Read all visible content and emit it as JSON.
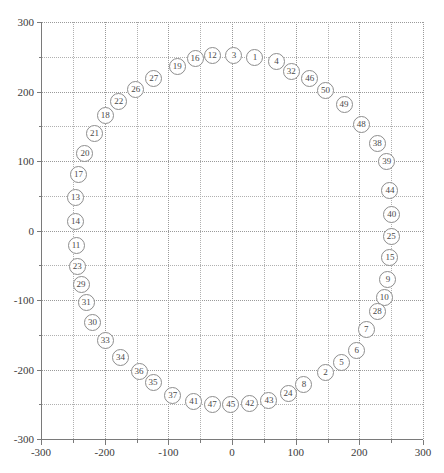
{
  "chart_data": {
    "type": "scatter",
    "title": "",
    "subtitle": "",
    "xlabel": "",
    "ylabel": "",
    "xlim": [
      -300,
      300
    ],
    "ylim": [
      -300,
      300
    ],
    "grid": true,
    "legend": null,
    "marker": "open-circle-with-number-label",
    "x_ticks": [
      -300,
      -200,
      -100,
      0,
      100,
      200,
      300
    ],
    "x_tick_labels": [
      "-300",
      "-200",
      "-100",
      "0",
      "100",
      "200",
      "300"
    ],
    "x_minor_ticks": [
      -250,
      -150,
      -50,
      50,
      150,
      250
    ],
    "y_ticks": [
      -300,
      -200,
      -100,
      0,
      100,
      200,
      300
    ],
    "y_tick_labels": [
      "-300",
      "-200",
      "-100",
      "0",
      "100",
      "200",
      "300"
    ],
    "y_minor_ticks": [
      -250,
      -150,
      -50,
      50,
      150,
      250
    ],
    "points": [
      {
        "label": "1",
        "x": 36,
        "y": 249
      },
      {
        "label": "2",
        "x": 147,
        "y": -205
      },
      {
        "label": "3",
        "x": 3,
        "y": 252
      },
      {
        "label": "4",
        "x": 70,
        "y": 243
      },
      {
        "label": "5",
        "x": 172,
        "y": -190
      },
      {
        "label": "6",
        "x": 196,
        "y": -172
      },
      {
        "label": "7",
        "x": 211,
        "y": -143
      },
      {
        "label": "8",
        "x": 113,
        "y": -221
      },
      {
        "label": "9",
        "x": 245,
        "y": -70
      },
      {
        "label": "10",
        "x": 239,
        "y": -97
      },
      {
        "label": "11",
        "x": -245,
        "y": -21
      },
      {
        "label": "12",
        "x": -31,
        "y": 252
      },
      {
        "label": "13",
        "x": -246,
        "y": 47
      },
      {
        "label": "14",
        "x": -246,
        "y": 13
      },
      {
        "label": "15",
        "x": 248,
        "y": -39
      },
      {
        "label": "16",
        "x": -58,
        "y": 247
      },
      {
        "label": "17",
        "x": -241,
        "y": 80
      },
      {
        "label": "18",
        "x": -199,
        "y": 165
      },
      {
        "label": "19",
        "x": -86,
        "y": 236
      },
      {
        "label": "20",
        "x": -231,
        "y": 111
      },
      {
        "label": "21",
        "x": -216,
        "y": 140
      },
      {
        "label": "22",
        "x": -178,
        "y": 185
      },
      {
        "label": "23",
        "x": -243,
        "y": -52
      },
      {
        "label": "24",
        "x": 88,
        "y": -235
      },
      {
        "label": "25",
        "x": 250,
        "y": -8
      },
      {
        "label": "26",
        "x": -151,
        "y": 203
      },
      {
        "label": "27",
        "x": -123,
        "y": 219
      },
      {
        "label": "28",
        "x": 228,
        "y": -117
      },
      {
        "label": "29",
        "x": -237,
        "y": -77
      },
      {
        "label": "30",
        "x": -219,
        "y": -132
      },
      {
        "label": "31",
        "x": -229,
        "y": -103
      },
      {
        "label": "32",
        "x": 93,
        "y": 229
      },
      {
        "label": "33",
        "x": -199,
        "y": -158
      },
      {
        "label": "34",
        "x": -175,
        "y": -183
      },
      {
        "label": "35",
        "x": -124,
        "y": -218
      },
      {
        "label": "36",
        "x": -146,
        "y": -203
      },
      {
        "label": "37",
        "x": -93,
        "y": -237
      },
      {
        "label": "38",
        "x": 228,
        "y": 125
      },
      {
        "label": "39",
        "x": 243,
        "y": 99
      },
      {
        "label": "40",
        "x": 251,
        "y": 23
      },
      {
        "label": "41",
        "x": -60,
        "y": -246
      },
      {
        "label": "42",
        "x": 28,
        "y": -249
      },
      {
        "label": "43",
        "x": 58,
        "y": -244
      },
      {
        "label": "44",
        "x": 248,
        "y": 58
      },
      {
        "label": "45",
        "x": -2,
        "y": -251
      },
      {
        "label": "46",
        "x": 122,
        "y": 219
      },
      {
        "label": "47",
        "x": -31,
        "y": -251
      },
      {
        "label": "48",
        "x": 203,
        "y": 152
      },
      {
        "label": "49",
        "x": 176,
        "y": 181
      },
      {
        "label": "50",
        "x": 147,
        "y": 201
      }
    ],
    "annotations": [],
    "caption": ""
  }
}
